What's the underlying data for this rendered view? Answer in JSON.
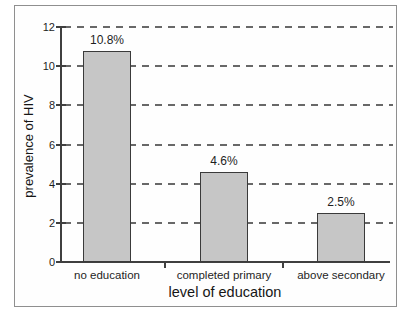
{
  "chart_data": {
    "type": "bar",
    "title": "",
    "xlabel": "level of education",
    "ylabel": "prevalence of HIV",
    "categories": [
      "no education",
      "completed primary",
      "above secondary"
    ],
    "values": [
      10.8,
      4.6,
      2.5
    ],
    "value_labels": [
      "10.8%",
      "4.6%",
      "2.5%"
    ],
    "yticks": [
      0,
      2,
      4,
      6,
      8,
      10,
      12
    ],
    "ylim": [
      0,
      12
    ],
    "grid": "dashed-horizontal",
    "legend": "none",
    "colors": {
      "bar_fill": "#c6c6c6",
      "bar_border": "#3a3a3a",
      "axis": "#3f3f3f",
      "grid": "#686868",
      "text": "#1e1e1e",
      "frame_border": "#8f8f8f",
      "background": "#ffffff"
    }
  }
}
